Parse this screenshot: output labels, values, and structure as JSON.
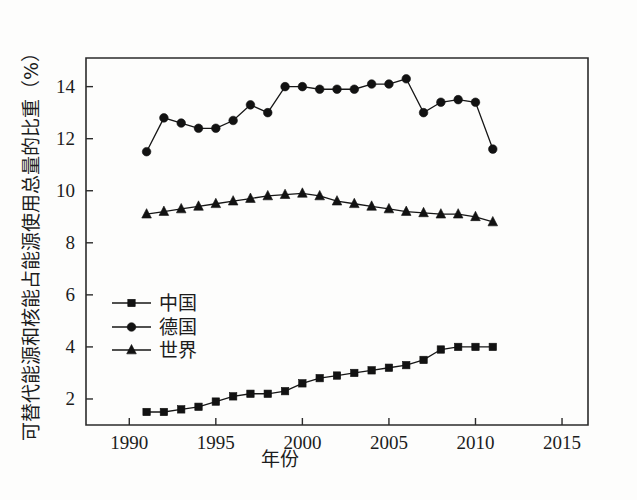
{
  "chart_data": {
    "type": "line",
    "title": "",
    "xlabel": "年份",
    "ylabel": "可替代代能源和核能占能源使用总量的比重（%）",
    "ylabel_text": "可替代能源和核能占能源使用总量的比重（%）",
    "xlim": [
      1987.5,
      2016.5
    ],
    "ylim": [
      1.0,
      15.1
    ],
    "xticks": [
      1990,
      1995,
      2000,
      2005,
      2010,
      2015
    ],
    "xtick_labels": [
      "1990",
      "1995",
      "2000",
      "2005",
      "2010",
      "2015"
    ],
    "yticks": [
      2,
      4,
      6,
      8,
      10,
      12,
      14
    ],
    "ytick_labels": [
      "2",
      "4",
      "6",
      "8",
      "10",
      "12",
      "14"
    ],
    "grid": false,
    "legend_position": "center-left",
    "x": [
      1991,
      1992,
      1993,
      1994,
      1995,
      1996,
      1997,
      1998,
      1999,
      2000,
      2001,
      2002,
      2003,
      2004,
      2005,
      2006,
      2007,
      2008,
      2009,
      2010,
      2011
    ],
    "series": [
      {
        "name": "中国",
        "marker": "square",
        "color": "#121212",
        "values": [
          1.5,
          1.5,
          1.6,
          1.7,
          1.9,
          2.1,
          2.2,
          2.2,
          2.3,
          2.6,
          2.8,
          2.9,
          3.0,
          3.1,
          3.2,
          3.3,
          3.5,
          3.9,
          4.0,
          4.0,
          4.0
        ]
      },
      {
        "name": "德国",
        "marker": "circle",
        "color": "#121212",
        "values": [
          11.5,
          12.8,
          12.6,
          12.4,
          12.4,
          12.7,
          13.3,
          13.0,
          14.0,
          14.0,
          13.9,
          13.9,
          13.9,
          14.1,
          14.1,
          14.3,
          13.0,
          13.4,
          13.5,
          13.4,
          11.6
        ]
      },
      {
        "name": "世界",
        "marker": "triangle",
        "color": "#121212",
        "values": [
          9.1,
          9.2,
          9.3,
          9.4,
          9.5,
          9.6,
          9.7,
          9.8,
          9.85,
          9.9,
          9.8,
          9.6,
          9.5,
          9.4,
          9.3,
          9.2,
          9.15,
          9.1,
          9.1,
          9.0,
          8.8
        ]
      }
    ]
  },
  "legend": {
    "items": [
      {
        "label": "中国"
      },
      {
        "label": "德国"
      },
      {
        "label": "世界"
      }
    ]
  }
}
